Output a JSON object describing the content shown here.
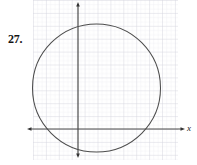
{
  "exercise": {
    "number_label": "27."
  },
  "figure": {
    "axis_labels": {
      "x": "x"
    },
    "colors": {
      "grid_minor": "#e9e9ee",
      "grid_major": "#d8d8e0",
      "axis": "#4a4a4a",
      "curve": "#4d4d4d",
      "background": "#ffffff",
      "text": "#141414"
    }
  },
  "chart_data": {
    "type": "scatter",
    "title": "",
    "subtitle": "",
    "xlabel": "x",
    "ylabel": "",
    "grid": true,
    "legend": null,
    "graph_paper": {
      "minor_cell_px": 4.3,
      "major_cell_px": 12.9,
      "minor_per_major": 3,
      "left_px": 33,
      "top_px": 0,
      "right_px": 178,
      "bottom_px": 160
    },
    "axes": {
      "origin_px": {
        "x": 78,
        "y": 129
      },
      "x_axis": {
        "y_px": 129,
        "start_px": 27,
        "end_px": 184,
        "arrow_start": true,
        "arrow_end": true
      },
      "y_axis": {
        "x_px": 78,
        "start_px": 2,
        "end_px": 158,
        "arrow_start": true,
        "arrow_end": true
      }
    },
    "shapes": [
      {
        "kind": "circle",
        "center_px": {
          "x": 96.5,
          "y": 88
        },
        "radius_px": 64,
        "center_units": {
          "x": 1.5,
          "y": 3.2
        },
        "radius_units": 5,
        "stroke": "#4d4d4d",
        "stroke_width_px": 1,
        "fill": "none"
      }
    ],
    "annotations": [
      {
        "text": "27.",
        "x_px": 8,
        "y_px": 32
      },
      {
        "text": "x",
        "x_px": 188,
        "y_px": 128
      }
    ]
  }
}
